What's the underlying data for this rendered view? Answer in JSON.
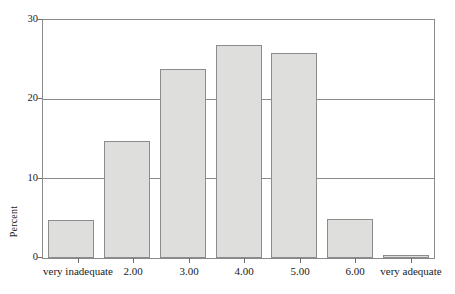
{
  "chart_data": {
    "type": "bar",
    "title": "",
    "subtitle": "",
    "xlabel": "",
    "ylabel": "Percent",
    "categories": [
      "very inadequate",
      "2.00",
      "3.00",
      "4.00",
      "5.00",
      "6.00",
      "very adequate"
    ],
    "values": [
      4.8,
      14.7,
      23.8,
      26.8,
      25.8,
      4.9,
      0.4
    ],
    "ylim": [
      0,
      30
    ],
    "yticks": [
      0,
      10,
      20,
      30
    ],
    "ytick_labels": [
      "0",
      "10",
      "20",
      "30"
    ],
    "grid": "horizontal",
    "legend": "none",
    "bar_fill_color": "#dededd",
    "bar_border_color": "#8c8c8c",
    "axis_color": "#8a8a8a",
    "text_color": "#1a1a1a"
  },
  "axis": {
    "y_title": "Percent",
    "ticks": [
      {
        "label": "30",
        "value": 30
      },
      {
        "label": "20",
        "value": 20
      },
      {
        "label": "10",
        "value": 10
      },
      {
        "label": "0",
        "value": 0
      }
    ]
  },
  "bars": [
    {
      "label": "very inadequate",
      "value": 4.8
    },
    {
      "label": "2.00",
      "value": 14.7
    },
    {
      "label": "3.00",
      "value": 23.8
    },
    {
      "label": "4.00",
      "value": 26.8
    },
    {
      "label": "5.00",
      "value": 25.8
    },
    {
      "label": "6.00",
      "value": 4.9
    },
    {
      "label": "very adequate",
      "value": 0.4
    }
  ]
}
